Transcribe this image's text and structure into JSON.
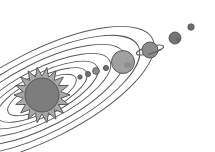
{
  "figure": {
    "title": "Solar System Diagram",
    "width": 215,
    "height": 152,
    "background_color": "#ffffff"
  },
  "palette": {
    "stroke": "#4d4d4d",
    "orbit_line": "#555555",
    "sun_corona_fill": "#a8a8a8",
    "sun_core_fill": "#7d7d7d",
    "planet_light": "#a0a0a0",
    "planet_mid": "#8c8c8c",
    "planet_dark": "#757575",
    "planet_tiny": "#6e6e6e",
    "ring_stroke": "#5a5a5a"
  },
  "sun": {
    "label": "Sun",
    "center_x": 42,
    "center_y": 95,
    "corona_radius": 28,
    "core_radius": 17,
    "spike_count": 18,
    "corona_color": "#a8a8a8",
    "core_color": "#7d7d7d"
  },
  "orbits": [
    {
      "name": "orbit-1-innermost",
      "rx": 38,
      "ry": 13,
      "rotation": -27,
      "color": "#555555"
    },
    {
      "name": "orbit-2",
      "rx": 50,
      "ry": 17,
      "rotation": -27,
      "color": "#555555"
    },
    {
      "name": "orbit-3",
      "rx": 62,
      "ry": 21,
      "rotation": -27,
      "color": "#555555"
    },
    {
      "name": "orbit-4",
      "rx": 76,
      "ry": 26,
      "rotation": -27,
      "color": "#555555"
    },
    {
      "name": "orbit-5",
      "rx": 92,
      "ry": 32,
      "rotation": -27,
      "color": "#555555"
    },
    {
      "name": "orbit-6",
      "rx": 108,
      "ry": 38,
      "rotation": -27,
      "color": "#555555"
    },
    {
      "name": "orbit-7-outermost",
      "rx": 124,
      "ry": 44,
      "rotation": -27,
      "color": "#555555"
    }
  ],
  "planets": [
    {
      "name": "planet-1",
      "label": "Mercury",
      "cx": 80,
      "cy": 77,
      "r": 2.2,
      "color": "#6e6e6e",
      "has_ring": false
    },
    {
      "name": "planet-2",
      "label": "Venus",
      "cx": 88,
      "cy": 74,
      "r": 2.6,
      "color": "#6e6e6e",
      "has_ring": false
    },
    {
      "name": "planet-3",
      "label": "Earth",
      "cx": 96,
      "cy": 71,
      "r": 3.4,
      "color": "#8c8c8c",
      "has_ring": false
    },
    {
      "name": "planet-4",
      "label": "Mars",
      "cx": 106,
      "cy": 68,
      "r": 2.6,
      "color": "#6e6e6e",
      "has_ring": false
    },
    {
      "name": "planet-5",
      "label": "Jupiter",
      "cx": 123,
      "cy": 62,
      "r": 11.5,
      "color": "#a0a0a0",
      "has_ring": false
    },
    {
      "name": "planet-6",
      "label": "Saturn",
      "cx": 150,
      "cy": 50,
      "r": 8.0,
      "color": "#8c8c8c",
      "has_ring": true,
      "ring_rx": 14,
      "ring_ry": 3.6,
      "ring_rotation": -15
    },
    {
      "name": "planet-7",
      "label": "Uranus",
      "cx": 175,
      "cy": 38,
      "r": 6.0,
      "color": "#757575",
      "has_ring": false
    },
    {
      "name": "planet-8",
      "label": "Neptune",
      "cx": 191,
      "cy": 27,
      "r": 3.2,
      "color": "#6e6e6e",
      "has_ring": false
    }
  ]
}
